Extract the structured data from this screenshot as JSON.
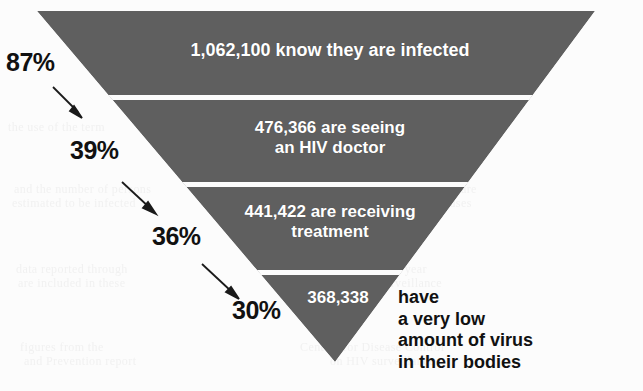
{
  "figure": {
    "colors": {
      "funnel_fill": "#5f5f5f",
      "background": "#fcfcfc",
      "band_text": "#ffffff",
      "label_text": "#111111",
      "separator": "#ffffff"
    }
  },
  "chart_data": {
    "type": "bar",
    "title": "",
    "subtitle": "",
    "xlabel": "",
    "ylabel": "",
    "orientation": "inverted-funnel",
    "categories": [
      "know they are infected",
      "are seeing an HIV doctor",
      "are receiving treatment",
      "have a very low amount of virus in their bodies"
    ],
    "values": [
      1062100,
      476366,
      441422,
      368338
    ],
    "value_labels": [
      "1,062,100",
      "476,366",
      "441,422",
      "368,338"
    ],
    "percent_labels": [
      "87%",
      "39%",
      "36%",
      "30%"
    ],
    "percents": [
      87,
      39,
      36,
      30
    ],
    "legend": [],
    "grid": false,
    "annotations": [
      "87%",
      "39%",
      "36%",
      "30%",
      "1,062,100 know they are infected",
      "476,366 are seeing an HIV doctor",
      "441,422 are receiving treatment",
      "368,338 have a very low amount of virus in their bodies"
    ]
  },
  "funnel": {
    "bands": [
      {
        "id": "band-aware",
        "value_label": "1,062,100",
        "text": "1,062,100 know they are infected",
        "percent": "87%"
      },
      {
        "id": "band-in-care",
        "value_label": "476,366",
        "text": "476,366 are seeing\nan HIV doctor",
        "percent": "39%"
      },
      {
        "id": "band-on-treatment",
        "value_label": "441,422",
        "text": "441,422 are receiving\ntreatment",
        "percent": "36%"
      },
      {
        "id": "band-suppressed",
        "value_label": "368,338",
        "text": "368,338",
        "percent": "30%"
      }
    ],
    "outcome_caption": "have\na very low\namount of virus\nin their bodies"
  },
  "background_showthrough": [
    {
      "text": "the use of the term",
      "x": 8,
      "y": 120
    },
    {
      "text": "people living with HIV infection",
      "x": 300,
      "y": 120
    },
    {
      "text": "and the number of persons",
      "x": 14,
      "y": 182
    },
    {
      "text": "in the United States who are",
      "x": 330,
      "y": 182
    },
    {
      "text": "estimated to be infected",
      "x": 12,
      "y": 196
    },
    {
      "text": "with the virus that causes",
      "x": 340,
      "y": 196
    },
    {
      "text": "data reported through",
      "x": 16,
      "y": 262
    },
    {
      "text": "the end of the year",
      "x": 330,
      "y": 262
    },
    {
      "text": "are included in these",
      "x": 18,
      "y": 276
    },
    {
      "text": "national surveillance",
      "x": 334,
      "y": 276
    },
    {
      "text": "figures from the",
      "x": 20,
      "y": 340
    },
    {
      "text": "Centers for Disease Control",
      "x": 300,
      "y": 340
    },
    {
      "text": "and Prevention report",
      "x": 24,
      "y": 354
    },
    {
      "text": "on HIV surveillance",
      "x": 330,
      "y": 354
    }
  ]
}
